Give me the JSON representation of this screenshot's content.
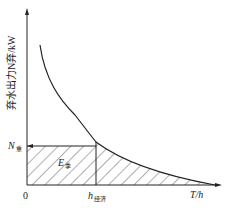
{
  "y_axis_label": "弃水出力N弃/kW",
  "x_axis_label": "T/h",
  "origin_label": "0",
  "n_level_label": "N",
  "n_level_sub": "重",
  "energy_label": "E",
  "energy_sub": "季",
  "h_label": "h",
  "h_sub": "经济"
}
